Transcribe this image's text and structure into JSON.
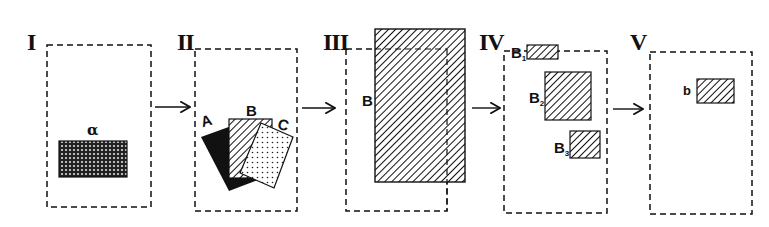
{
  "panels": [
    {
      "id": "I",
      "label": "I",
      "shapes": [
        {
          "label": "α",
          "fill": "crosshatch"
        }
      ]
    },
    {
      "id": "II",
      "label": "II",
      "shapes": [
        {
          "label": "A",
          "fill": "solid-black"
        },
        {
          "label": "B",
          "fill": "diagonal-hatch"
        },
        {
          "label": "C",
          "fill": "dotted"
        }
      ]
    },
    {
      "id": "III",
      "label": "III",
      "shapes": [
        {
          "label": "B",
          "fill": "diagonal-hatch"
        }
      ]
    },
    {
      "id": "IV",
      "label": "IV",
      "shapes": [
        {
          "label": "B",
          "sub": "1",
          "fill": "diagonal-hatch"
        },
        {
          "label": "B",
          "sub": "2",
          "fill": "diagonal-hatch"
        },
        {
          "label": "B",
          "sub": "3",
          "fill": "diagonal-hatch"
        }
      ]
    },
    {
      "id": "V",
      "label": "V",
      "shapes": [
        {
          "label": "b",
          "fill": "diagonal-hatch"
        }
      ]
    }
  ],
  "arrows": [
    "I→II",
    "II→III",
    "III→IV",
    "IV→V"
  ],
  "colors": {
    "ink": "#111111",
    "background": "#ffffff"
  }
}
